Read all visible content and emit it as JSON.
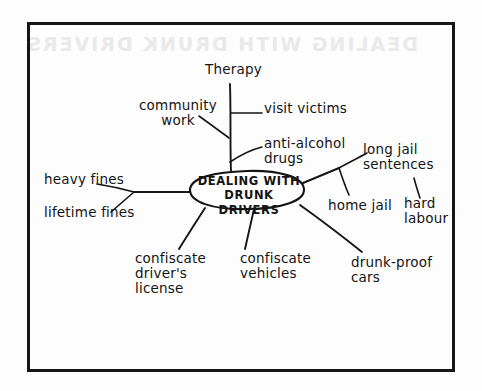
{
  "page": {
    "kind": "hand-drawn-mindmap",
    "ink_color": "#151515",
    "paper_color": "#fdfdfd",
    "border_color": "#161616",
    "ghost_text": "DEALING WITH DRUNK DRIVERS"
  },
  "mindmap": {
    "center": {
      "line1": "DEALING WITH",
      "line2": "DRUNK DRIVERS"
    },
    "branches": [
      {
        "id": "therapy",
        "label": "Therapy"
      },
      {
        "id": "community-work",
        "label": "community\nwork"
      },
      {
        "id": "visit-victims",
        "label": "visit victims"
      },
      {
        "id": "anti-alcohol-drugs",
        "label": "anti-alcohol\n   drugs"
      },
      {
        "id": "heavy-fines",
        "label": "heavy fines"
      },
      {
        "id": "lifetime-fines",
        "label": "lifetime fines"
      },
      {
        "id": "long-jail-sentences",
        "label": "long jail\n  sentences"
      },
      {
        "id": "hard-labour",
        "label": "hard\nlabour"
      },
      {
        "id": "home-jail",
        "label": "home jail"
      },
      {
        "id": "drunk-proof-cars",
        "label": "drunk-proof\n      cars"
      },
      {
        "id": "confiscate-vehicles",
        "label": "confiscate\n vehicles"
      },
      {
        "id": "confiscate-license",
        "label": "confiscate\n driver's\n license"
      }
    ]
  }
}
